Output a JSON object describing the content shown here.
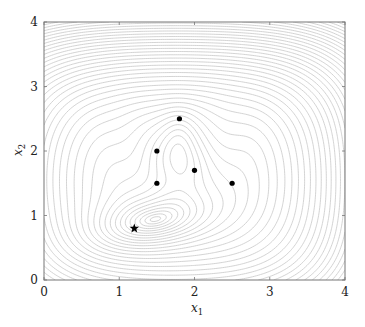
{
  "chart_data": {
    "type": "contour",
    "title": "",
    "xlabel": "x_1",
    "ylabel": "x_2",
    "xlim": [
      0,
      4
    ],
    "ylim": [
      0,
      4
    ],
    "xticks": [
      0,
      1,
      2,
      3,
      4
    ],
    "yticks": [
      0,
      1,
      2,
      3,
      4
    ],
    "grid": false,
    "legend": null,
    "contour_color": "#c8c8c8",
    "frame_color": "#777777",
    "points": [
      {
        "x": 1.8,
        "y": 2.5,
        "marker": "dot"
      },
      {
        "x": 1.5,
        "y": 2.0,
        "marker": "dot"
      },
      {
        "x": 2.0,
        "y": 1.7,
        "marker": "dot"
      },
      {
        "x": 1.5,
        "y": 1.5,
        "marker": "dot"
      },
      {
        "x": 2.5,
        "y": 1.5,
        "marker": "dot"
      }
    ],
    "optimum": {
      "x": 1.2,
      "y": 0.8,
      "marker": "star"
    },
    "marker_color": "#000000"
  },
  "axes": {
    "x_label_main": "x",
    "x_label_sub": "1",
    "y_label_main": "x",
    "y_label_sub": "2",
    "x_tick_labels": [
      "0",
      "1",
      "2",
      "3",
      "4"
    ],
    "y_tick_labels": [
      "0",
      "1",
      "2",
      "3",
      "4"
    ]
  }
}
